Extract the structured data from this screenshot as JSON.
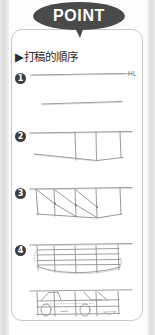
{
  "banner": {
    "label": "POINT",
    "shape": "speech-balloon-ellipse",
    "fill_color": "#4a4a4a",
    "text_color": "#ffffff"
  },
  "panel": {
    "background_color": "#ffffff",
    "border_color": "#c9c9c9",
    "corner_radius_px": 11
  },
  "heading": {
    "bullet": "▶",
    "text": "▶打稿的順序",
    "plain_text": "打稿的順序",
    "translation_note": "order of rough drafting"
  },
  "annotations": {
    "horizon_line_label": "HL"
  },
  "steps": [
    {
      "number": "❶",
      "numeral": "1",
      "figure_name": "horizon-and-base-line",
      "description": "horizontal horizon line labelled HL with a second shorter guide line below"
    },
    {
      "number": "❷",
      "numeral": "2",
      "figure_name": "perspective-box-frame",
      "description": "top line with three vertical drop lines and a lower converging line forming a box"
    },
    {
      "number": "❸",
      "numeral": "3",
      "figure_name": "diagonal-division-lines",
      "description": "box subdivided with diagonal lines marking section midpoints"
    },
    {
      "number": "❹",
      "numeral": "4",
      "figure_name": "body-grid-lines",
      "description": "grid of horizontal body lines and a rounded lower body contour"
    }
  ],
  "final_figure": {
    "figure_name": "car-outline-sketch",
    "description": "finished rough car outline with two wheel ellipses and dashed centre guide"
  },
  "colors": {
    "sketch_line": "#8d8d8d",
    "marker_fill": "#3d3d3d",
    "gutter_gray": "#dcdcdc"
  }
}
